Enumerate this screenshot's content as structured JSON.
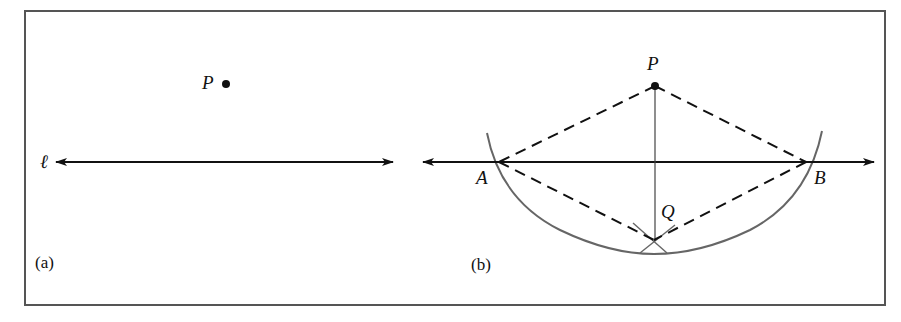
{
  "figure": {
    "colors": {
      "background": "#ffffff",
      "frame": "#555555",
      "ink": "#111111",
      "arc": "#666666"
    },
    "panel_a": {
      "caption": "(a)",
      "line_label": "ℓ",
      "point_label": "P"
    },
    "panel_b": {
      "caption": "(b)",
      "point_P_label": "P",
      "point_A_label": "A",
      "point_B_label": "B",
      "point_Q_label": "Q"
    }
  }
}
